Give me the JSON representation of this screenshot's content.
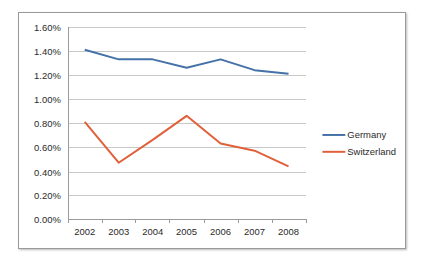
{
  "chart_data": {
    "type": "line",
    "title": "",
    "xlabel": "",
    "ylabel": "",
    "categories": [
      "2002",
      "2003",
      "2004",
      "2005",
      "2006",
      "2007",
      "2008"
    ],
    "x_tick_labels": [
      "2002",
      "2003",
      "2004",
      "2005",
      "2006",
      "2007",
      "2008"
    ],
    "y_tick_labels": [
      "0.00%",
      "0.20%",
      "0.40%",
      "0.60%",
      "0.80%",
      "1.00%",
      "1.20%",
      "1.40%",
      "1.60%"
    ],
    "y_tick_values": [
      0.0,
      0.2,
      0.4,
      0.6,
      0.8,
      1.0,
      1.2,
      1.4,
      1.6
    ],
    "ylim": [
      0.0,
      1.6
    ],
    "y_unit": "%",
    "grid": "horizontal",
    "legend_position": "right",
    "series": [
      {
        "name": "Germany",
        "color": "#4472A8",
        "values": [
          1.41,
          1.33,
          1.33,
          1.26,
          1.33,
          1.24,
          1.21
        ]
      },
      {
        "name": "Switzerland",
        "color": "#E0603A",
        "values": [
          0.81,
          0.47,
          0.66,
          0.86,
          0.63,
          0.57,
          0.44
        ]
      }
    ]
  },
  "legend": {
    "entries": [
      {
        "label": "Germany",
        "color": "#4472A8"
      },
      {
        "label": "Switzerland",
        "color": "#E0603A"
      }
    ]
  },
  "colors": {
    "germany": "#4472A8",
    "switzerland": "#E0603A",
    "gridline": "#c8c8c8",
    "axis": "#9a9a9a",
    "text": "#2a2a2a",
    "background": "#ffffff"
  }
}
